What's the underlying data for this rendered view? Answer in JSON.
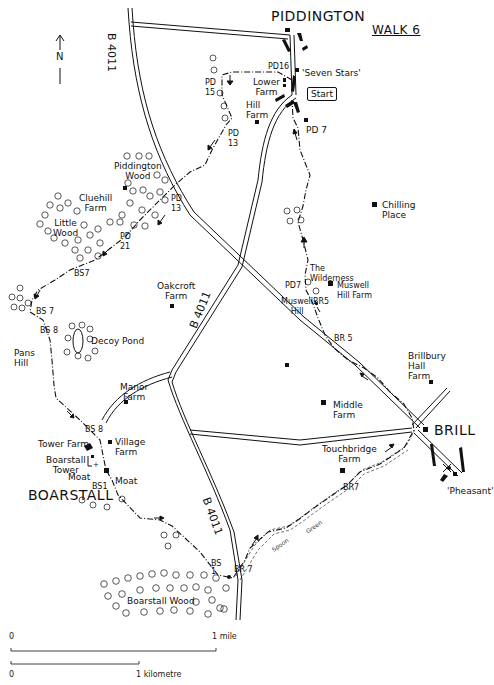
{
  "title": "WALK 6",
  "north": {
    "label": "N"
  },
  "villages": [
    {
      "id": "piddington",
      "label": "PIDDINGTON"
    },
    {
      "id": "boarstall",
      "label": "BOARSTALL"
    },
    {
      "id": "brill",
      "label": "BRILL"
    }
  ],
  "roads": {
    "b4011_north": "B 4011",
    "b4011_mid": "B 4011",
    "b4011_south": "B 4011"
  },
  "start": {
    "label": "Start"
  },
  "places": {
    "seven_stars": "'Seven Stars'",
    "lower_farm": "Lower\nFarm",
    "hill_farm": "Hill\nFarm",
    "piddington_wood": "Piddington\nWood",
    "cluehill_farm": "Cluehill\nFarm",
    "little_wood": "Little\nWood",
    "chilling_place": "Chilling\nPlace",
    "the_wilderness": "The\nWilderness",
    "muswell_hill_farm": "Muswell\nHill Farm",
    "muswell_hill": "Muswell\nHill",
    "oakcroft_farm": "Oakcroft\nFarm",
    "decoy_pond": "Decoy Pond",
    "pans_hill": "Pans\nHill",
    "manor_farm": "Manor\nFarm",
    "tower_farm": "Tower Farm",
    "village_farm": "Village\nFarm",
    "boarstall_tower": "Boarstall\nTower",
    "moat_left": "Moat",
    "moat_right": "Moat",
    "brillbury_hall_farm": "Brillbury\nHall\nFarm",
    "middle_farm": "Middle\nFarm",
    "touchbridge_farm": "Touchbridge\nFarm",
    "pheasant": "'Pheasant'",
    "boarstall_wood": "Boarstall Wood",
    "spoon": "Spoon",
    "green": "Green"
  },
  "path_codes": {
    "pd16": "PD16",
    "pd15": "PD\n15",
    "pd13_upper": "PD\n13",
    "pd13_lower": "PD\n13",
    "pd21": "PD\n21",
    "pd7_top": "PD 7",
    "pd7_mid": "PD7",
    "bs7_upper": "BS7",
    "bs7_lower": "BS 7",
    "bs8_upper": "BS 8",
    "bs8_lower": "BS 8",
    "bs1_upper": "BS1",
    "bs1_lower": "BS\n1",
    "br5_upper": "BR5",
    "br5_lower": "BR 5",
    "br7_upper": "BR7",
    "br7_lower": "BR 7"
  },
  "scale": {
    "mile_zero": "0",
    "mile_label": "1 mile",
    "km_zero": "0",
    "km_label": "1 kilometre"
  }
}
